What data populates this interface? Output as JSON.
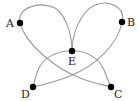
{
  "diagram": {
    "type": "graph",
    "nodes": [
      {
        "id": "A",
        "label": "A",
        "x": 20,
        "y": 23,
        "lx": 6,
        "ly": 27
      },
      {
        "id": "B",
        "label": "B",
        "x": 122,
        "y": 22,
        "lx": 127,
        "ly": 26
      },
      {
        "id": "E",
        "label": "E",
        "x": 72,
        "y": 51,
        "lx": 68,
        "ly": 65
      },
      {
        "id": "D",
        "label": "D",
        "x": 33,
        "y": 87,
        "lx": 21,
        "ly": 98
      },
      {
        "id": "C",
        "label": "C",
        "x": 111,
        "y": 87,
        "lx": 114,
        "ly": 98
      }
    ],
    "edges": [
      {
        "from": "A",
        "to": "E",
        "shape": "loop-top-left"
      },
      {
        "from": "E",
        "to": "B",
        "shape": "loop-top-right"
      },
      {
        "from": "A",
        "to": "C",
        "shape": "curve"
      },
      {
        "from": "B",
        "to": "D",
        "shape": "curve"
      },
      {
        "from": "E",
        "to": "D",
        "shape": "arc"
      },
      {
        "from": "E",
        "to": "C",
        "shape": "arc"
      }
    ],
    "colors": {
      "edge": "#9a9a9a",
      "node": "#000000",
      "label": "#222222"
    }
  }
}
